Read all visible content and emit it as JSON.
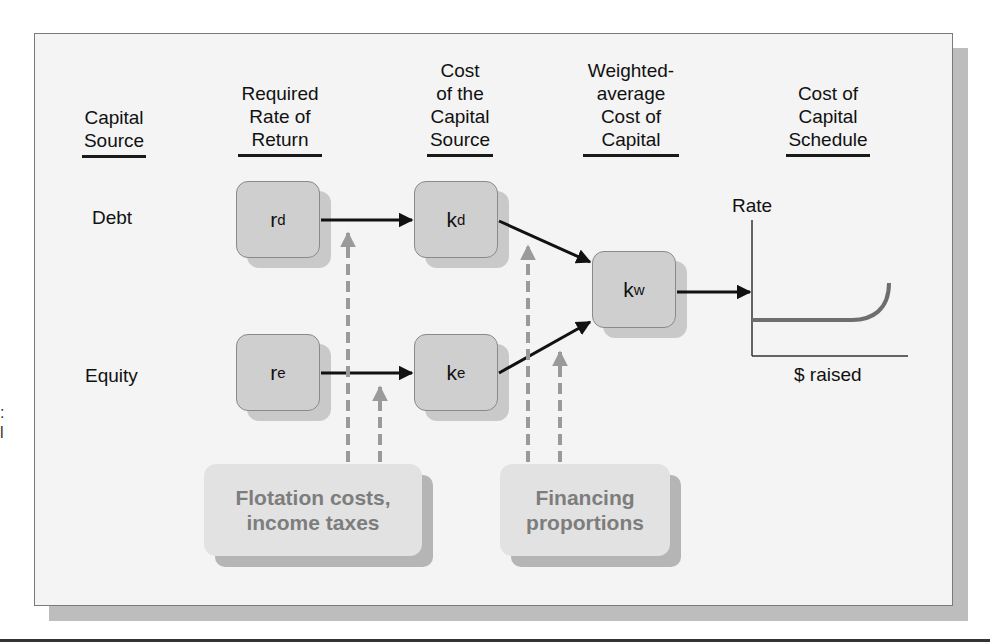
{
  "columns": [
    {
      "id": "capital-source",
      "lines": [
        "Capital",
        "Source"
      ]
    },
    {
      "id": "required-rate",
      "lines": [
        "Required",
        "Rate of",
        "Return"
      ]
    },
    {
      "id": "cost-of-source",
      "lines": [
        "Cost",
        "of the",
        "Capital",
        "Source"
      ]
    },
    {
      "id": "wacc",
      "lines": [
        "Weighted-",
        "average",
        "Cost of",
        "Capital"
      ]
    },
    {
      "id": "schedule",
      "lines": [
        "Cost of",
        "Capital",
        "Schedule"
      ]
    }
  ],
  "rows": {
    "debt": "Debt",
    "equity": "Equity"
  },
  "nodes": {
    "rd": {
      "base": "r",
      "sub": "d"
    },
    "re": {
      "base": "r",
      "sub": "e"
    },
    "kd": {
      "base": "k",
      "sub": "d"
    },
    "ke": {
      "base": "k",
      "sub": "e"
    },
    "kw": {
      "base": "k",
      "sub": "w"
    }
  },
  "notes": {
    "flotation": [
      "Flotation costs,",
      "income taxes"
    ],
    "financing": [
      "Financing",
      "proportions"
    ]
  },
  "schedule_chart": {
    "y_label": "Rate",
    "x_label": "$ raised"
  },
  "margin_marks": [
    ":",
    "l"
  ],
  "colors": {
    "node_fill": "#cfcfcf",
    "note_text": "#7d7d7d",
    "dashed_arrow": "#9a9a9a",
    "curve": "#6e6e6e",
    "frame_bg": "#f4f4f4"
  }
}
